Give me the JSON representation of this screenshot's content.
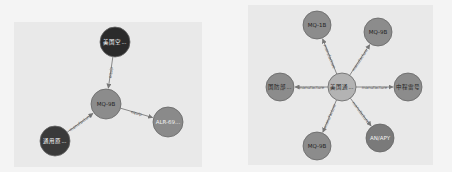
{
  "graphs": [
    {
      "panel": {
        "x": 14,
        "y": 22,
        "w": 188,
        "h": 145
      },
      "nodes": [
        {
          "id": "n1",
          "label": "美国空...",
          "x": 115,
          "y": 42,
          "r": 15,
          "fill": "#2b2b2b",
          "text": "#ffffff"
        },
        {
          "id": "n2",
          "label": "MQ-9B",
          "x": 106,
          "y": 104,
          "r": 15,
          "fill": "#8c8c8c",
          "text": "#222222"
        },
        {
          "id": "n3",
          "label": "ALR-69...",
          "x": 168,
          "y": 122,
          "r": 15,
          "fill": "#8a8a8a",
          "text": "#f0f0f0"
        },
        {
          "id": "n4",
          "label": "通用原...",
          "x": 55,
          "y": 141,
          "r": 15,
          "fill": "#3a3a3a",
          "text": "#ffffff"
        }
      ],
      "edges": [
        {
          "from": "n1",
          "to": "n2",
          "label": "equip"
        },
        {
          "from": "n2",
          "to": "n3",
          "label": "equip"
        },
        {
          "from": "n4",
          "to": "n2",
          "label": "manufacture"
        }
      ]
    },
    {
      "panel": {
        "x": 248,
        "y": 5,
        "w": 185,
        "h": 160
      },
      "nodes": [
        {
          "id": "c",
          "label": "美国通...",
          "x": 342,
          "y": 87,
          "r": 14,
          "fill": "#b3b3b3",
          "text": "#222222"
        },
        {
          "id": "a",
          "label": "MQ-1B",
          "x": 317,
          "y": 25,
          "r": 14,
          "fill": "#8c8c8c",
          "text": "#222222"
        },
        {
          "id": "b",
          "label": "MQ-9B",
          "x": 378,
          "y": 32,
          "r": 14,
          "fill": "#8c8c8c",
          "text": "#222222"
        },
        {
          "id": "d",
          "label": "国防部...",
          "x": 280,
          "y": 87,
          "r": 14,
          "fill": "#8c8c8c",
          "text": "#222222"
        },
        {
          "id": "e",
          "label": "中程雷号",
          "x": 408,
          "y": 87,
          "r": 14,
          "fill": "#8c8c8c",
          "text": "#222222"
        },
        {
          "id": "f",
          "label": "MQ-9B",
          "x": 317,
          "y": 146,
          "r": 14,
          "fill": "#8c8c8c",
          "text": "#222222"
        },
        {
          "id": "g",
          "label": "AN/APY",
          "x": 380,
          "y": 138,
          "r": 14,
          "fill": "#7a7a7a",
          "text": "#f0f0f0"
        }
      ],
      "edges": [
        {
          "from": "c",
          "to": "a",
          "label": "manufacture"
        },
        {
          "from": "c",
          "to": "b",
          "label": "manufacture"
        },
        {
          "from": "c",
          "to": "d",
          "label": "manufacture"
        },
        {
          "from": "c",
          "to": "e",
          "label": "manufacture"
        },
        {
          "from": "c",
          "to": "f",
          "label": "manufacture"
        },
        {
          "from": "c",
          "to": "g",
          "label": "manufacture"
        }
      ]
    }
  ]
}
